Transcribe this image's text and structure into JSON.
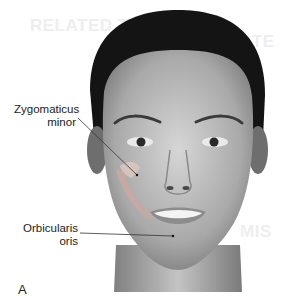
{
  "figure": {
    "panel_letter": "A",
    "labels": [
      {
        "id": "zygomaticus-minor",
        "line1": "Zygomaticus",
        "line2": "minor"
      },
      {
        "id": "orbicularis-oris",
        "line1": "Orbicularis",
        "line2": "oris"
      }
    ]
  },
  "bleed_through": {
    "line1": "RELATED TO OTHER",
    "line2": "STE",
    "line3": "MIS"
  },
  "colors": {
    "skin": "#b8b8b8",
    "hair": "#111111",
    "muscle": "#c9a9a2",
    "label_text": "#222222"
  }
}
